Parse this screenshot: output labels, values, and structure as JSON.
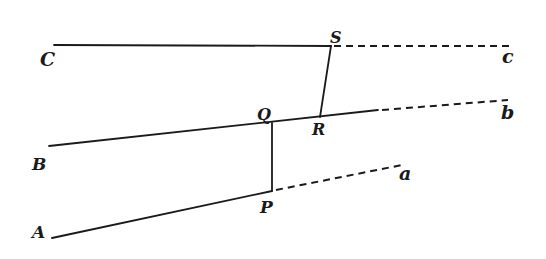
{
  "diagram": {
    "type": "geometric-construction",
    "stroke_color": "#1a1a1a",
    "background": "#ffffff",
    "points": {
      "C": {
        "label": "C",
        "x": 54,
        "y": 45
      },
      "S": {
        "label": "S",
        "x": 331,
        "y": 46
      },
      "c": {
        "label": "c",
        "x": 513,
        "y": 46
      },
      "B": {
        "label": "B",
        "x": 49,
        "y": 146
      },
      "Q": {
        "label": "Q",
        "x": 272,
        "y": 123
      },
      "R": {
        "label": "R",
        "x": 320,
        "y": 117
      },
      "b": {
        "label": "b",
        "x": 508,
        "y": 100
      },
      "A": {
        "label": "A",
        "x": 52,
        "y": 238
      },
      "P": {
        "label": "P",
        "x": 272,
        "y": 191
      },
      "a": {
        "label": "a",
        "x": 402,
        "y": 165
      }
    },
    "labels": {
      "C": "C",
      "S": "S",
      "c": "c",
      "Q": "Q",
      "R": "R",
      "b": "b",
      "B": "B",
      "a": "a",
      "P": "P",
      "A": "A"
    },
    "segments": [
      {
        "from": "C",
        "to": "S",
        "style": "solid"
      },
      {
        "from": "S",
        "to": "c",
        "style": "dashed"
      },
      {
        "from": "S",
        "to": "R",
        "style": "solid"
      },
      {
        "from": "B",
        "to": "R",
        "style": "solid"
      },
      {
        "from": "R",
        "to": "b",
        "style": "solid-then-dashed"
      },
      {
        "from": "Q",
        "to": "P",
        "style": "solid"
      },
      {
        "from": "A",
        "to": "P",
        "style": "solid"
      },
      {
        "from": "P",
        "to": "a",
        "style": "dashed"
      }
    ]
  }
}
